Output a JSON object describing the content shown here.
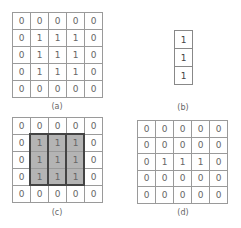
{
  "panels": {
    "a": {
      "label": "(a)",
      "matrix": [
        [
          0,
          0,
          0,
          0,
          0
        ],
        [
          0,
          1,
          1,
          1,
          0
        ],
        [
          0,
          1,
          1,
          1,
          0
        ],
        [
          0,
          1,
          1,
          1,
          0
        ],
        [
          0,
          0,
          0,
          0,
          0
        ]
      ]
    },
    "b": {
      "label": "(b)",
      "matrix": [
        [
          1
        ],
        [
          1
        ],
        [
          1
        ]
      ]
    },
    "c": {
      "label": "(c)",
      "matrix": [
        [
          0,
          0,
          0,
          0,
          0
        ],
        [
          0,
          1,
          1,
          1,
          0
        ],
        [
          0,
          1,
          1,
          1,
          0
        ],
        [
          0,
          1,
          1,
          1,
          0
        ],
        [
          0,
          0,
          0,
          0,
          0
        ]
      ],
      "highlight": {
        "rows": [
          1,
          3
        ],
        "cols": [
          1,
          3
        ],
        "fill": "#b4b4b4",
        "outline": "#444444"
      }
    },
    "d": {
      "label": "(d)",
      "matrix": [
        [
          0,
          0,
          0,
          0,
          0
        ],
        [
          0,
          0,
          0,
          0,
          0
        ],
        [
          0,
          1,
          1,
          1,
          0
        ],
        [
          0,
          0,
          0,
          0,
          0
        ],
        [
          0,
          0,
          0,
          0,
          0
        ]
      ]
    }
  }
}
